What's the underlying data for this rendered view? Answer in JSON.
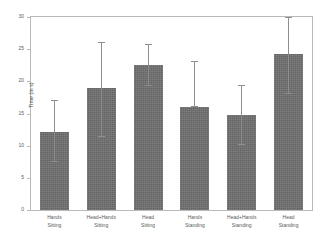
{
  "chart_data": {
    "type": "bar",
    "title": "",
    "xlabel": "",
    "ylabel": "Time (in s)",
    "ylim": [
      0,
      30
    ],
    "yticks": [
      0,
      5,
      10,
      15,
      20,
      25,
      30
    ],
    "ytick_labels": [
      "0",
      "5",
      "10",
      "15",
      "20",
      "25",
      "30"
    ],
    "grid": false,
    "legend": null,
    "bar_color": "#6f6f6f",
    "errorbar_color": "#8e8e8e",
    "axes_color": "#b9b9b9",
    "categories": [
      "Hands Sitting",
      "Head+Hands Sitting",
      "Head Sitting",
      "Hands Standing",
      "Head+Hands Standing",
      "Head Standing"
    ],
    "category_lines": [
      [
        "Hands",
        "Sitting"
      ],
      [
        "Head+Hands",
        "Sitting"
      ],
      [
        "Head",
        "Sitting"
      ],
      [
        "Hands",
        "Standing"
      ],
      [
        "Head+Hands",
        "Standing"
      ],
      [
        "Head",
        "Standing"
      ]
    ],
    "values": [
      12.2,
      18.9,
      22.6,
      16.0,
      14.7,
      24.3
    ],
    "err_upper": [
      16.9,
      26.0,
      25.7,
      23.0,
      19.3,
      29.8
    ],
    "err_lower": [
      7.5,
      11.4,
      19.2,
      16.0,
      10.1,
      18.0
    ]
  }
}
